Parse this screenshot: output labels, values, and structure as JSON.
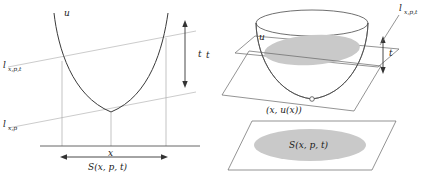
{
  "figure": {
    "title": "",
    "panels": [
      {
        "id": "left-panel-2d",
        "description": "2D parabola with two parallel support lines",
        "labels": {
          "curve": "u",
          "upper_line": "l",
          "upper_line_sub": "x,p,t",
          "lower_line": "l",
          "lower_line_sub": "x,p",
          "height_arrow": "t",
          "axis_point": "x",
          "interval": "S(x, p, t)"
        }
      },
      {
        "id": "right-panel-3d",
        "description": "3D paraboloid cut by two parallel planes with shaded elliptical sections",
        "labels": {
          "surface": "u",
          "upper_plane": "l",
          "upper_plane_sub": "x,p,t",
          "left_axis": "t",
          "height_arrow": "t",
          "contact_point": "(x, u(x))",
          "base_region": "S(x, p, t)"
        }
      }
    ]
  },
  "colors": {
    "curve": "#2b2b2b",
    "support_line": "#c8c8c8",
    "plane_edge": "#555555",
    "shade": "#c9c9c9",
    "axis": "#555555",
    "text": "#1a1a1a",
    "thin_guide": "#9a9a9a"
  }
}
